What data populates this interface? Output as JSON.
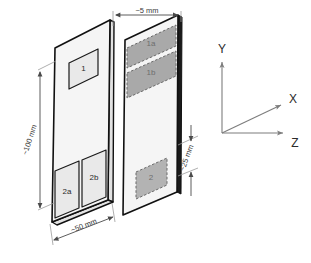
{
  "diagram": {
    "projection": "isometric",
    "front_plate": {
      "name": "front-plate",
      "regions": [
        {
          "id": "region-1",
          "label": "1",
          "style": "solid-outline"
        },
        {
          "id": "region-2a",
          "label": "2a",
          "style": "solid-outline"
        },
        {
          "id": "region-2b",
          "label": "2b",
          "style": "solid-outline"
        }
      ]
    },
    "back_plate": {
      "name": "back-plate",
      "regions": [
        {
          "id": "region-1a",
          "label": "1a",
          "style": "dashed-shaded"
        },
        {
          "id": "region-1b",
          "label": "1b",
          "style": "dashed-shaded"
        },
        {
          "id": "region-2",
          "label": "2",
          "style": "dashed-shaded"
        }
      ]
    }
  },
  "dimensions": [
    {
      "id": "dim-thickness",
      "label": "~5 mm",
      "value": 5,
      "unit": "mm",
      "position": "top",
      "orientation": "horizontal"
    },
    {
      "id": "dim-height",
      "label": "~100 mm",
      "value": 100,
      "unit": "mm",
      "position": "left",
      "orientation": "vertical"
    },
    {
      "id": "dim-width",
      "label": "~50 mm",
      "value": 50,
      "unit": "mm",
      "position": "bottom",
      "orientation": "diagonal"
    },
    {
      "id": "dim-band",
      "label": "~25 mm",
      "value": 25,
      "unit": "mm",
      "position": "right",
      "orientation": "vertical"
    }
  ],
  "axes": {
    "name": "coordinate-axes",
    "items": [
      {
        "id": "axis-y",
        "label": "Y",
        "direction": "up"
      },
      {
        "id": "axis-x",
        "label": "X",
        "direction": "up-right-diagonal"
      },
      {
        "id": "axis-z",
        "label": "Z",
        "direction": "right"
      }
    ]
  },
  "colors": {
    "plate_fill": "#f5f5f5",
    "plate_outline": "#111111",
    "region_shaded": "#a9a9a9",
    "region_light": "#e9e9e9",
    "dimension_line": "#4a4a4a",
    "axis_line": "#7d7d7d",
    "background": "#ffffff"
  }
}
